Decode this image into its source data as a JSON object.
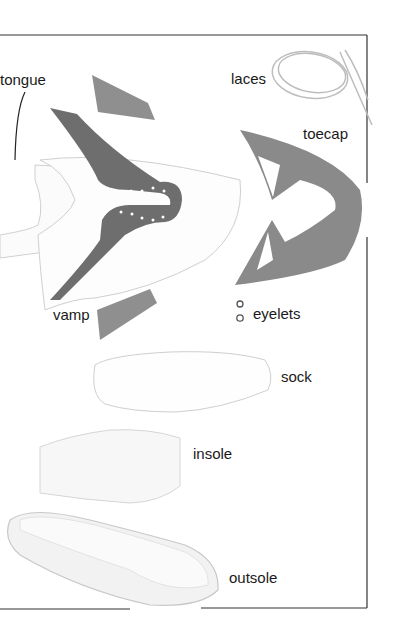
{
  "diagram": {
    "colors": {
      "leather_dark": "#6e6e6e",
      "leather_light": "#8f8f8f",
      "frame": "#333333",
      "outline": "#c8c8c8"
    },
    "labels": {
      "tongue": "tongue",
      "laces": "laces",
      "toecap": "toecap",
      "vamp": "vamp",
      "eyelets": "eyelets",
      "sock": "sock",
      "insole": "insole",
      "outsole": "outsole"
    }
  }
}
